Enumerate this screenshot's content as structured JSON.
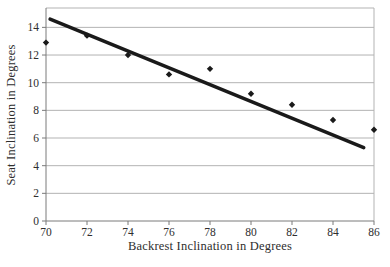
{
  "chart_data": {
    "type": "scatter",
    "title": "",
    "xlabel": "Backrest Inclination in Degrees",
    "ylabel": "Seat Inclination in Degrees",
    "x": [
      70,
      72,
      74,
      76,
      78,
      80,
      82,
      84,
      86
    ],
    "y": [
      12.9,
      13.4,
      12.0,
      10.6,
      11.0,
      9.2,
      8.4,
      7.3,
      6.6
    ],
    "series": [
      {
        "name": "observed-seat-inclination",
        "marker": "diamond",
        "points": [
          {
            "x": 70,
            "y": 12.9
          },
          {
            "x": 72,
            "y": 13.4
          },
          {
            "x": 74,
            "y": 12.0
          },
          {
            "x": 76,
            "y": 10.6
          },
          {
            "x": 78,
            "y": 11.0
          },
          {
            "x": 80,
            "y": 9.2
          },
          {
            "x": 82,
            "y": 8.4
          },
          {
            "x": 84,
            "y": 7.3
          },
          {
            "x": 86,
            "y": 6.6
          }
        ]
      }
    ],
    "trendline": {
      "x1": 70.2,
      "y1": 14.6,
      "x2": 85.5,
      "y2": 5.3
    },
    "xlim": [
      70,
      86
    ],
    "ylim": [
      0,
      15.4
    ],
    "x_ticks": [
      70,
      72,
      74,
      76,
      78,
      80,
      82,
      84,
      86
    ],
    "y_ticks": [
      0,
      2,
      4,
      6,
      8,
      10,
      12,
      14
    ],
    "grid": "horizontal",
    "legend": "none",
    "colors": {
      "marker": "#1a1a1a",
      "trendline": "#1a1a1a",
      "gridline": "#b3b3b3",
      "border": "#b3b3b3",
      "axis": "#7a7a7a",
      "text": "#2e2e2e",
      "background": "#ffffff"
    }
  }
}
